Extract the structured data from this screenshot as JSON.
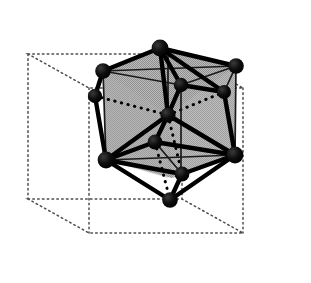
{
  "figure": {
    "title": "Polyhedral cluster inscribed in a cubic unit cell",
    "width": 311,
    "height": 283
  },
  "style": {
    "background_color": "#ffffff",
    "face_fill_color": "#b3b3b3",
    "face_fill_color_dark": "#a8a8a8",
    "edge_color": "#000000",
    "hidden_edge_color": "#000000",
    "cell_outline_color": "#555555",
    "atom_color": "#000000",
    "atom_highlight_color": "#333333",
    "solid_edge_width": 4.4,
    "thin_edge_width": 1.6,
    "hidden_edge_width": 3.0,
    "cell_edge_width": 1.5,
    "cell_dash_pattern": "1.6 3.2",
    "hidden_dash_pattern": "0.4 6.4",
    "atom_radius_large": 8.2,
    "atom_radius_medium": 7.0,
    "atom_radius_small": 6.0
  },
  "unit_cell": {
    "name": "dotted-cubic-unit-cell",
    "vertices": {
      "front_bottom_left": [
        89,
        233
      ],
      "front_bottom_right": [
        243,
        233
      ],
      "front_top_left": [
        89,
        141
      ],
      "front_top_right": [
        243,
        141
      ],
      "back_bottom_left": [
        28,
        199
      ],
      "back_bottom_right": [
        182,
        199
      ],
      "back_top_left": [
        28,
        54
      ],
      "back_top_right": [
        182,
        54
      ]
    },
    "vertices_upper": {
      "top_back_left": [
        28,
        54
      ],
      "top_back_right": [
        182,
        54
      ],
      "top_front_left": [
        89,
        88
      ],
      "top_front_right": [
        243,
        88
      ]
    },
    "edges": [
      [
        "top_back_left",
        "top_back_right"
      ],
      [
        "top_back_right",
        "top_front_right"
      ],
      [
        "top_front_right",
        "top_front_left"
      ],
      [
        "top_front_left",
        "top_back_left"
      ],
      [
        "bottom_back_left",
        "bottom_back_right"
      ],
      [
        "bottom_back_right",
        "bottom_front_right"
      ],
      [
        "bottom_front_right",
        "bottom_front_left"
      ],
      [
        "bottom_front_left",
        "bottom_back_left"
      ],
      [
        "top_back_left",
        "bottom_back_left"
      ],
      [
        "top_back_right",
        "bottom_back_right"
      ],
      [
        "top_front_left",
        "bottom_front_left"
      ],
      [
        "top_front_right",
        "bottom_front_right"
      ]
    ]
  },
  "cluster": {
    "name": "atom-cluster",
    "shaded_faces": [
      {
        "name": "cube-silhouette-face",
        "points": "160,48 236,66 236,155 172,178 106,160 103,71",
        "fill": "#b3b3b3"
      }
    ],
    "atoms": [
      {
        "id": "apex-top",
        "cx": 160,
        "cy": 48,
        "r": 8.4,
        "label": "top apex vertex"
      },
      {
        "id": "corner-upper-left",
        "cx": 103,
        "cy": 71,
        "r": 7.8,
        "label": "upper left cube corner"
      },
      {
        "id": "corner-upper-right",
        "cx": 236,
        "cy": 66,
        "r": 7.8,
        "label": "upper right cube corner"
      },
      {
        "id": "interior-upper",
        "cx": 181,
        "cy": 85,
        "r": 7.2,
        "label": "upper interior vertex"
      },
      {
        "id": "interior-right",
        "cx": 224,
        "cy": 92,
        "r": 7.0,
        "label": "right interior vertex"
      },
      {
        "id": "center",
        "cx": 168,
        "cy": 115,
        "r": 7.6,
        "label": "central vertex"
      },
      {
        "id": "satellite-left",
        "cx": 95,
        "cy": 96,
        "r": 7.2,
        "label": "left protruding vertex"
      },
      {
        "id": "interior-lower",
        "cx": 155,
        "cy": 142,
        "r": 7.4,
        "label": "lower interior vertex"
      },
      {
        "id": "corner-lower-left",
        "cx": 106,
        "cy": 160,
        "r": 8.4,
        "label": "lower left hub vertex"
      },
      {
        "id": "corner-lower-right",
        "cx": 235,
        "cy": 155,
        "r": 8.4,
        "label": "lower right hub vertex"
      },
      {
        "id": "front-lower",
        "cx": 182,
        "cy": 174,
        "r": 7.4,
        "label": "front lower vertex"
      },
      {
        "id": "apex-bottom",
        "cx": 170,
        "cy": 200,
        "r": 7.8,
        "label": "bottom apex vertex"
      }
    ],
    "solid_edges": [
      [
        "apex-top",
        "corner-upper-left"
      ],
      [
        "apex-top",
        "corner-upper-right"
      ],
      [
        "apex-top",
        "interior-upper"
      ],
      [
        "apex-top",
        "center"
      ],
      [
        "apex-top",
        "interior-right"
      ],
      [
        "corner-upper-left",
        "satellite-left"
      ],
      [
        "satellite-left",
        "corner-lower-left"
      ],
      [
        "center",
        "interior-upper"
      ],
      [
        "center",
        "corner-lower-left"
      ],
      [
        "center",
        "corner-lower-right"
      ],
      [
        "center",
        "interior-lower"
      ],
      [
        "interior-right",
        "corner-lower-right"
      ],
      [
        "interior-upper",
        "interior-right"
      ],
      [
        "interior-lower",
        "corner-lower-left"
      ],
      [
        "interior-lower",
        "corner-lower-right"
      ],
      [
        "corner-lower-left",
        "apex-bottom"
      ],
      [
        "corner-lower-right",
        "apex-bottom"
      ],
      [
        "corner-lower-left",
        "front-lower"
      ],
      [
        "corner-lower-right",
        "front-lower"
      ],
      [
        "front-lower",
        "apex-bottom"
      ]
    ],
    "thin_edges": [
      [
        "corner-upper-left",
        "corner-upper-right"
      ],
      [
        "corner-upper-left",
        "corner-lower-left"
      ],
      [
        "corner-upper-right",
        "corner-lower-right"
      ],
      [
        "corner-lower-left",
        "corner-lower-right"
      ],
      [
        "interior-upper",
        "corner-upper-left"
      ],
      [
        "interior-upper",
        "corner-upper-right"
      ],
      [
        "interior-right",
        "corner-upper-right"
      ],
      [
        "interior-lower",
        "front-lower"
      ]
    ],
    "hidden_edges": [
      [
        "satellite-left",
        "center"
      ],
      [
        "center",
        "interior-right"
      ],
      [
        "center",
        "front-lower"
      ],
      [
        "interior-lower",
        "apex-bottom"
      ],
      [
        "interior-upper",
        "interior-lower"
      ]
    ]
  }
}
